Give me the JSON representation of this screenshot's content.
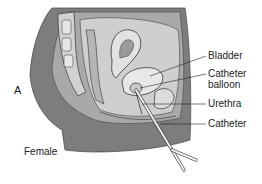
{
  "figure": {
    "panel_letter": "A",
    "caption_label": "Female",
    "labels": [
      {
        "id": "bladder",
        "text": "Bladder"
      },
      {
        "id": "catheter-balloon-1",
        "text": "Catheter"
      },
      {
        "id": "catheter-balloon-2",
        "text": "balloon"
      },
      {
        "id": "urethra",
        "text": "Urethra"
      },
      {
        "id": "catheter",
        "text": "Catheter"
      }
    ],
    "colors": {
      "dark_tissue": "#7a7a7a",
      "mid_tissue": "#a8a8a8",
      "light_tissue": "#d4d4d4",
      "outline": "#333333"
    }
  }
}
